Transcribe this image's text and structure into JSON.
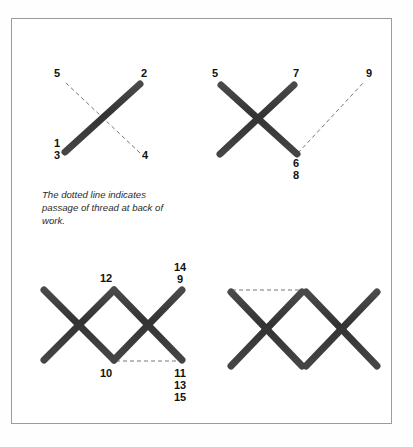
{
  "plate": {
    "background_color": "#ffffff",
    "frame_color": "#9b9b9b",
    "thread_color": "#3a3a3a",
    "dash_color": "#777777",
    "label_color": "#111111"
  },
  "caption": {
    "full_text": "The dotted line indicates passage of thread at back of work.",
    "lines": [
      "The dotted line indicates",
      "passage of thread at back of",
      "work."
    ]
  },
  "diagrams": [
    {
      "id": "diagram-step-1",
      "name": "first-half-cross-stitch",
      "labels": [
        {
          "text": "5",
          "x": 57,
          "y": 77
        },
        {
          "text": "2",
          "x": 144,
          "y": 77
        },
        {
          "text": "1",
          "x": 57,
          "y": 147
        },
        {
          "text": "3",
          "x": 57,
          "y": 159
        },
        {
          "text": "4",
          "x": 145,
          "y": 159
        }
      ],
      "strokes": [
        {
          "name": "stroke-1-to-2",
          "x1": 65,
          "y1": 152,
          "x2": 140,
          "y2": 84,
          "width": 7.0
        },
        {
          "name": "stroke-3-to-4",
          "x1": 65,
          "y1": 155,
          "x2": 142,
          "y2": 155,
          "width": 6.2
        }
      ],
      "dashes": [
        {
          "name": "dash-4-to-5",
          "x1": 140,
          "y1": 153,
          "x2": 65,
          "y2": 82
        }
      ]
    },
    {
      "id": "diagram-step-2",
      "name": "completed-cross-with-upright",
      "labels": [
        {
          "text": "5",
          "x": 215,
          "y": 77
        },
        {
          "text": "7",
          "x": 296,
          "y": 77
        },
        {
          "text": "9",
          "x": 369,
          "y": 77
        },
        {
          "text": "6",
          "x": 296,
          "y": 167
        },
        {
          "text": "8",
          "x": 296,
          "y": 179
        }
      ],
      "strokes": [
        {
          "name": "stroke-5-to-6",
          "x1": 221,
          "y1": 85,
          "x2": 297,
          "y2": 154,
          "width": 7.0
        },
        {
          "name": "stroke-7-to-left-base",
          "x1": 294,
          "y1": 85,
          "x2": 220,
          "y2": 154,
          "width": 7.0
        },
        {
          "name": "stroke-base-horizontal",
          "x1": 220,
          "y1": 155,
          "x2": 296,
          "y2": 155,
          "width": 6.2
        },
        {
          "name": "stroke-7-to-6-upright",
          "x1": 296,
          "y1": 84,
          "x2": 296,
          "y2": 155,
          "width": 6.2
        }
      ],
      "dashes": [
        {
          "name": "dash-6-to-9",
          "x1": 298,
          "y1": 153,
          "x2": 364,
          "y2": 82
        }
      ]
    },
    {
      "id": "diagram-step-3",
      "name": "row-of-three-crosses",
      "labels": [
        {
          "text": "12",
          "x": 106,
          "y": 282
        },
        {
          "text": "14",
          "x": 180,
          "y": 271
        },
        {
          "text": "9",
          "x": 180,
          "y": 283
        },
        {
          "text": "10",
          "x": 106,
          "y": 377
        },
        {
          "text": "11",
          "x": 180,
          "y": 377
        },
        {
          "text": "13",
          "x": 180,
          "y": 389
        },
        {
          "text": "15",
          "x": 180,
          "y": 401
        }
      ],
      "strokes": [
        {
          "name": "stroke-left-cross-down",
          "x1": 44,
          "y1": 290,
          "x2": 114,
          "y2": 360,
          "width": 7.0
        },
        {
          "name": "stroke-left-cross-up",
          "x1": 114,
          "y1": 290,
          "x2": 44,
          "y2": 360,
          "width": 7.0
        },
        {
          "name": "stroke-left-base",
          "x1": 44,
          "y1": 361,
          "x2": 114,
          "y2": 361,
          "width": 6.2
        },
        {
          "name": "stroke-mid-upright",
          "x1": 114,
          "y1": 289,
          "x2": 114,
          "y2": 361,
          "width": 6.2
        },
        {
          "name": "stroke-right-cross-down",
          "x1": 114,
          "y1": 290,
          "x2": 182,
          "y2": 360,
          "width": 7.0
        },
        {
          "name": "stroke-right-cross-up",
          "x1": 182,
          "y1": 290,
          "x2": 114,
          "y2": 360,
          "width": 7.0
        },
        {
          "name": "stroke-right-upright",
          "x1": 182,
          "y1": 289,
          "x2": 182,
          "y2": 361,
          "width": 6.2
        }
      ],
      "dashes": [
        {
          "name": "dash-10-to-11",
          "x1": 116,
          "y1": 361,
          "x2": 180,
          "y2": 361
        }
      ]
    },
    {
      "id": "diagram-step-4",
      "name": "two-completed-squares",
      "labels": [],
      "strokes": [
        {
          "name": "square-a-left",
          "x1": 231,
          "y1": 292,
          "x2": 231,
          "y2": 366,
          "width": 6.4
        },
        {
          "name": "square-a-top",
          "x1": 231,
          "y1": 292,
          "x2": 302,
          "y2": 292,
          "width": 6.4
        },
        {
          "name": "square-a-right",
          "x1": 302,
          "y1": 292,
          "x2": 302,
          "y2": 366,
          "width": 6.4
        },
        {
          "name": "square-a-bottom",
          "x1": 231,
          "y1": 366,
          "x2": 302,
          "y2": 366,
          "width": 6.4
        },
        {
          "name": "square-a-diag-down",
          "x1": 231,
          "y1": 292,
          "x2": 302,
          "y2": 366,
          "width": 7.0
        },
        {
          "name": "square-a-diag-up",
          "x1": 302,
          "y1": 292,
          "x2": 231,
          "y2": 366,
          "width": 7.0
        },
        {
          "name": "square-b-left",
          "x1": 306,
          "y1": 292,
          "x2": 306,
          "y2": 366,
          "width": 6.4
        },
        {
          "name": "square-b-top",
          "x1": 306,
          "y1": 292,
          "x2": 377,
          "y2": 292,
          "width": 6.4
        },
        {
          "name": "square-b-right",
          "x1": 377,
          "y1": 292,
          "x2": 377,
          "y2": 366,
          "width": 6.4
        },
        {
          "name": "square-b-bottom",
          "x1": 306,
          "y1": 366,
          "x2": 377,
          "y2": 366,
          "width": 6.4
        },
        {
          "name": "square-b-diag-down",
          "x1": 306,
          "y1": 292,
          "x2": 377,
          "y2": 366,
          "width": 7.0
        },
        {
          "name": "square-b-diag-up",
          "x1": 377,
          "y1": 292,
          "x2": 306,
          "y2": 366,
          "width": 7.0
        }
      ],
      "dashes": [
        {
          "name": "dash-square-a-top-back",
          "x1": 232,
          "y1": 290,
          "x2": 301,
          "y2": 290
        }
      ]
    }
  ],
  "caption_position": {
    "x": 42,
    "y": 198,
    "line_height": 13
  }
}
